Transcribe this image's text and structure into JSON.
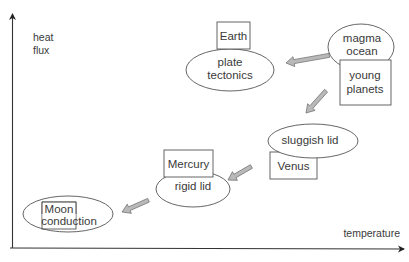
{
  "axes": {
    "y_label_line1": "heat",
    "y_label_line2": "flux",
    "x_label": "temperature"
  },
  "nodes": {
    "earth": {
      "planet": "Earth",
      "regime_line1": "plate",
      "regime_line2": "tectonics"
    },
    "young_planets": {
      "regime_line1": "magma",
      "regime_line2": "ocean",
      "planet_line1": "young",
      "planet_line2": "planets"
    },
    "venus": {
      "regime": "sluggish lid",
      "planet": "Venus"
    },
    "mercury": {
      "planet": "Mercury",
      "regime": "rigid lid"
    },
    "moon": {
      "planet": "Moon",
      "regime": "conduction"
    }
  },
  "arrows": [
    {
      "from": "young_planets",
      "to": "earth"
    },
    {
      "from": "young_planets",
      "to": "venus"
    },
    {
      "from": "venus",
      "to": "mercury"
    },
    {
      "from": "mercury",
      "to": "moon"
    }
  ],
  "colors": {
    "arrow_fill": "#b9b9b9",
    "arrow_stroke": "#6f6f6f",
    "shape_stroke": "#555555",
    "text": "#3a3a3a"
  }
}
